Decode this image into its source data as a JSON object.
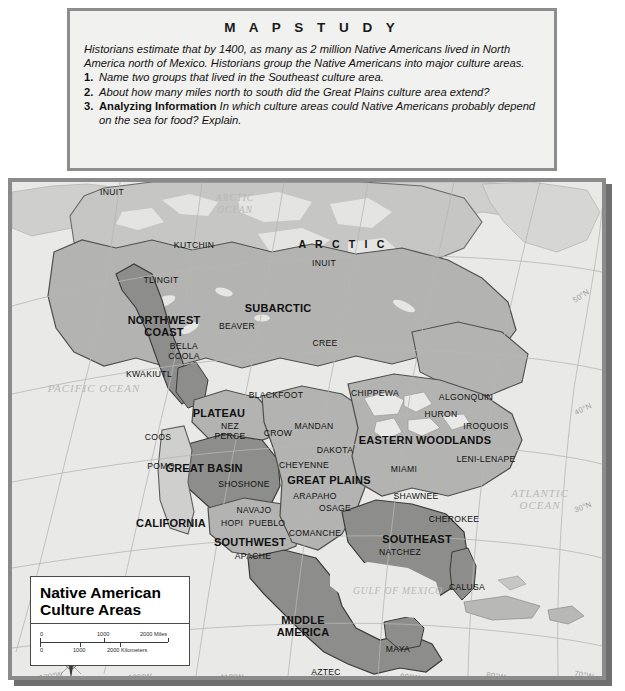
{
  "mapstudy": {
    "title": "M A P   S T U D Y",
    "intro": "Historians estimate that by 1400, as many as 2 million Native Americans lived in North America north of Mexico. Historians group the Native Americans into major culture areas.",
    "questions": [
      {
        "num": "1.",
        "lead": "",
        "text": "Name two groups that lived in the Southeast culture area."
      },
      {
        "num": "2.",
        "lead": "",
        "text": "About how many miles north to south did the Great Plains culture area extend?"
      },
      {
        "num": "3.",
        "lead": "Analyzing Information",
        "text": "In which culture areas could Native Americans probably depend on the sea for food? Explain."
      }
    ]
  },
  "legend": {
    "title_line1": "Native American",
    "title_line2": "Culture Areas",
    "scale": {
      "miles": {
        "zero": "0",
        "mid": "1000",
        "end": "2000 Miles"
      },
      "kilometers": {
        "zero": "0",
        "mid": "1000",
        "end": "2000 Kilometers"
      }
    }
  },
  "compass": {
    "n": "N",
    "s": "S",
    "e": "E",
    "w": "W"
  },
  "map": {
    "oceans": [
      {
        "name": "arctic-ocean",
        "text": "ARCTIC\nOCEAN",
        "x": 231,
        "y": 205,
        "size": "sm"
      },
      {
        "name": "pacific-ocean",
        "text": "PACIFIC OCEAN",
        "x": 90,
        "y": 389,
        "size": "lg"
      },
      {
        "name": "atlantic-ocean",
        "text": "ATLANTIC\nOCEAN",
        "x": 536,
        "y": 500,
        "size": "lg"
      },
      {
        "name": "gulf-of-mexico",
        "text": "GULF OF MEXICO",
        "x": 394,
        "y": 592,
        "size": "sm"
      }
    ],
    "culture_areas": [
      {
        "name": "arctic",
        "label": "A R C T I C",
        "x": 339,
        "y": 245,
        "style": "arctic"
      },
      {
        "name": "subarctic",
        "label": "SUBARCTIC",
        "x": 274,
        "y": 309,
        "style": "big"
      },
      {
        "name": "northwest-coast",
        "label": "NORTHWEST\nCOAST",
        "x": 160,
        "y": 327,
        "style": "big"
      },
      {
        "name": "plateau",
        "label": "PLATEAU",
        "x": 215,
        "y": 414,
        "style": "big"
      },
      {
        "name": "great-basin",
        "label": "GREAT BASIN",
        "x": 200,
        "y": 469,
        "style": "big"
      },
      {
        "name": "california",
        "label": "CALIFORNIA",
        "x": 167,
        "y": 524,
        "style": "big"
      },
      {
        "name": "southwest",
        "label": "SOUTHWEST",
        "x": 246,
        "y": 543,
        "style": "big"
      },
      {
        "name": "great-plains",
        "label": "GREAT PLAINS",
        "x": 325,
        "y": 481,
        "style": "big"
      },
      {
        "name": "eastern-woodlands",
        "label": "EASTERN WOODLANDS",
        "x": 421,
        "y": 441,
        "style": "big"
      },
      {
        "name": "southeast",
        "label": "SOUTHEAST",
        "x": 413,
        "y": 540,
        "style": "big"
      },
      {
        "name": "middle-america",
        "label": "MIDDLE\nAMERICA",
        "x": 299,
        "y": 627,
        "style": "big"
      }
    ],
    "tribes": [
      {
        "name": "inuit-alaska",
        "label": "INUIT",
        "x": 108,
        "y": 193
      },
      {
        "name": "kutchin",
        "label": "KUTCHIN",
        "x": 190,
        "y": 246
      },
      {
        "name": "tlingit",
        "label": "TLINGIT",
        "x": 157,
        "y": 281
      },
      {
        "name": "inuit-arctic",
        "label": "INUIT",
        "x": 320,
        "y": 264
      },
      {
        "name": "beaver",
        "label": "BEAVER",
        "x": 233,
        "y": 327
      },
      {
        "name": "cree",
        "label": "CREE",
        "x": 321,
        "y": 344
      },
      {
        "name": "bella-coola",
        "label": "BELLA\nCOOLA",
        "x": 180,
        "y": 352
      },
      {
        "name": "kwakiutl",
        "label": "KWAKIUTL",
        "x": 145,
        "y": 375
      },
      {
        "name": "blackfoot",
        "label": "BLACKFOOT",
        "x": 272,
        "y": 396
      },
      {
        "name": "chippewa",
        "label": "CHIPPEWA",
        "x": 371,
        "y": 394
      },
      {
        "name": "algonquin",
        "label": "ALGONQUIN",
        "x": 462,
        "y": 398
      },
      {
        "name": "huron",
        "label": "HURON",
        "x": 437,
        "y": 415
      },
      {
        "name": "iroquois",
        "label": "IROQUOIS",
        "x": 482,
        "y": 427
      },
      {
        "name": "nez-perce",
        "label": "NEZ\nPERCE",
        "x": 226,
        "y": 432
      },
      {
        "name": "crow",
        "label": "CROW",
        "x": 274,
        "y": 434
      },
      {
        "name": "mandan",
        "label": "MANDAN",
        "x": 310,
        "y": 427
      },
      {
        "name": "dakota",
        "label": "DAKOTA",
        "x": 331,
        "y": 451
      },
      {
        "name": "coos",
        "label": "COOS",
        "x": 154,
        "y": 438
      },
      {
        "name": "leni-lenape",
        "label": "LENI-LENAPE",
        "x": 482,
        "y": 460
      },
      {
        "name": "miami",
        "label": "MIAMI",
        "x": 400,
        "y": 470
      },
      {
        "name": "cheyenne",
        "label": "CHEYENNE",
        "x": 300,
        "y": 466
      },
      {
        "name": "pomo",
        "label": "POMO",
        "x": 157,
        "y": 467
      },
      {
        "name": "shoshone",
        "label": "SHOSHONE",
        "x": 240,
        "y": 485
      },
      {
        "name": "arapaho",
        "label": "ARAPAHO",
        "x": 311,
        "y": 497
      },
      {
        "name": "shawnee",
        "label": "SHAWNEE",
        "x": 412,
        "y": 497
      },
      {
        "name": "osage",
        "label": "OSAGE",
        "x": 331,
        "y": 509
      },
      {
        "name": "cherokee",
        "label": "CHEROKEE",
        "x": 450,
        "y": 520
      },
      {
        "name": "navajo",
        "label": "NAVAJO",
        "x": 250,
        "y": 511
      },
      {
        "name": "hopi",
        "label": "HOPI",
        "x": 228,
        "y": 524
      },
      {
        "name": "pueblo",
        "label": "PUEBLO",
        "x": 263,
        "y": 524
      },
      {
        "name": "comanche",
        "label": "COMANCHE",
        "x": 311,
        "y": 534
      },
      {
        "name": "apache",
        "label": "APACHE",
        "x": 249,
        "y": 557
      },
      {
        "name": "natchez",
        "label": "NATCHEZ",
        "x": 396,
        "y": 553
      },
      {
        "name": "calusa",
        "label": "CALUSA",
        "x": 463,
        "y": 588
      },
      {
        "name": "maya",
        "label": "MAYA",
        "x": 394,
        "y": 650
      },
      {
        "name": "aztec",
        "label": "AZTEC",
        "x": 322,
        "y": 673
      }
    ],
    "graticule_labels": [
      {
        "name": "lon-130w",
        "label": "130°W",
        "x": 47,
        "y": 677,
        "rot": -8
      },
      {
        "name": "lon-120w",
        "label": "120°W",
        "x": 136,
        "y": 678,
        "rot": -4
      },
      {
        "name": "lon-110w",
        "label": "110°W",
        "x": 228,
        "y": 678,
        "rot": -1
      },
      {
        "name": "lon-100w",
        "label": "100°W",
        "x": 320,
        "y": 678,
        "rot": 1
      },
      {
        "name": "lon-90w",
        "label": "90°W",
        "x": 406,
        "y": 678,
        "rot": 4
      },
      {
        "name": "lon-80w",
        "label": "80°W",
        "x": 492,
        "y": 677,
        "rot": 7
      },
      {
        "name": "lon-70w",
        "label": "70°W",
        "x": 580,
        "y": 676,
        "rot": 10
      },
      {
        "name": "lat-50n",
        "label": "50°N",
        "x": 590,
        "y": 297,
        "rot": -34
      },
      {
        "name": "lat-40n",
        "label": "40°N",
        "x": 592,
        "y": 410,
        "rot": -26
      },
      {
        "name": "lat-30n",
        "label": "30°N",
        "x": 592,
        "y": 508,
        "rot": -20
      }
    ]
  },
  "colors": {
    "ocean": "#e9e9e7",
    "land_light": "#dcdcda",
    "land_medium": "#b3b3b1",
    "land_dark": "#8d8d8b",
    "frame": "#8b8b8b",
    "box_bg": "#f1f1ef"
  }
}
